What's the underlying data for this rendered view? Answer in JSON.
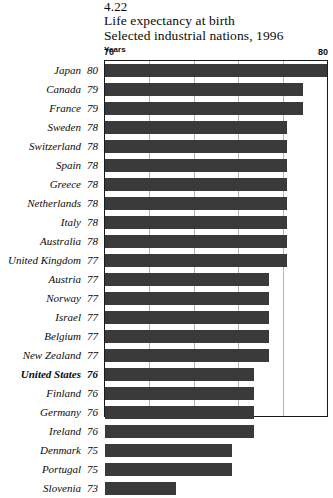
{
  "header": {
    "figure_number": "4.22",
    "title_line1": "Life expectancy at birth",
    "title_line2": "Selected industrial nations, 1996",
    "units": "Years"
  },
  "axis": {
    "min_label": "70",
    "max_label": "80"
  },
  "style": {
    "bar_color": "#3a3a3a",
    "grid_color": "#b4b4b4",
    "frame_color": "#1a1a1a",
    "background": "#ffffff"
  },
  "chart_data": {
    "type": "bar",
    "orientation": "horizontal",
    "title": "Life expectancy at birth",
    "subtitle": "Selected industrial nations, 1996",
    "figure_number": "4.22",
    "xlabel": "Years",
    "ylabel": "",
    "xlim": [
      70,
      80
    ],
    "grid": true,
    "gridlines": [
      72,
      74,
      76,
      78
    ],
    "tick_labels": [
      "70",
      "80"
    ],
    "legend": "none",
    "highlight": "United States",
    "categories": [
      "Japan",
      "Canada",
      "France",
      "Sweden",
      "Switzerland",
      "Spain",
      "Greece",
      "Netherlands",
      "Italy",
      "Australia",
      "United Kingdom",
      "Austria",
      "Norway",
      "Israel",
      "Belgium",
      "New Zealand",
      "United States",
      "Finland",
      "Germany",
      "Ireland",
      "Denmark",
      "Portugal",
      "Slovenia"
    ],
    "values": [
      80,
      79,
      79,
      78,
      78,
      78,
      78,
      78,
      78,
      78,
      77,
      77,
      77,
      77,
      77,
      77,
      76,
      76,
      76,
      76,
      75,
      75,
      73
    ],
    "bar_lengths": [
      80.0,
      78.9,
      78.9,
      78.2,
      78.2,
      78.2,
      78.2,
      78.2,
      78.2,
      78.2,
      78.2,
      77.4,
      77.4,
      77.4,
      77.4,
      77.4,
      76.7,
      76.7,
      76.7,
      76.7,
      75.7,
      75.7,
      73.2
    ],
    "rows": [
      {
        "label": "Japan",
        "value": "80",
        "length": 80.0,
        "highlight": false
      },
      {
        "label": "Canada",
        "value": "79",
        "length": 78.9,
        "highlight": false
      },
      {
        "label": "France",
        "value": "79",
        "length": 78.9,
        "highlight": false
      },
      {
        "label": "Sweden",
        "value": "78",
        "length": 78.2,
        "highlight": false
      },
      {
        "label": "Switzerland",
        "value": "78",
        "length": 78.2,
        "highlight": false
      },
      {
        "label": "Spain",
        "value": "78",
        "length": 78.2,
        "highlight": false
      },
      {
        "label": "Greece",
        "value": "78",
        "length": 78.2,
        "highlight": false
      },
      {
        "label": "Netherlands",
        "value": "78",
        "length": 78.2,
        "highlight": false
      },
      {
        "label": "Italy",
        "value": "78",
        "length": 78.2,
        "highlight": false
      },
      {
        "label": "Australia",
        "value": "78",
        "length": 78.2,
        "highlight": false
      },
      {
        "label": "United Kingdom",
        "value": "77",
        "length": 78.2,
        "highlight": false
      },
      {
        "label": "Austria",
        "value": "77",
        "length": 77.4,
        "highlight": false
      },
      {
        "label": "Norway",
        "value": "77",
        "length": 77.4,
        "highlight": false
      },
      {
        "label": "Israel",
        "value": "77",
        "length": 77.4,
        "highlight": false
      },
      {
        "label": "Belgium",
        "value": "77",
        "length": 77.4,
        "highlight": false
      },
      {
        "label": "New Zealand",
        "value": "77",
        "length": 77.4,
        "highlight": false
      },
      {
        "label": "United States",
        "value": "76",
        "length": 76.7,
        "highlight": true
      },
      {
        "label": "Finland",
        "value": "76",
        "length": 76.7,
        "highlight": false
      },
      {
        "label": "Germany",
        "value": "76",
        "length": 76.7,
        "highlight": false
      },
      {
        "label": "Ireland",
        "value": "76",
        "length": 76.7,
        "highlight": false
      },
      {
        "label": "Denmark",
        "value": "75",
        "length": 75.7,
        "highlight": false
      },
      {
        "label": "Portugal",
        "value": "75",
        "length": 75.7,
        "highlight": false
      },
      {
        "label": "Slovenia",
        "value": "73",
        "length": 73.2,
        "highlight": false
      }
    ]
  }
}
